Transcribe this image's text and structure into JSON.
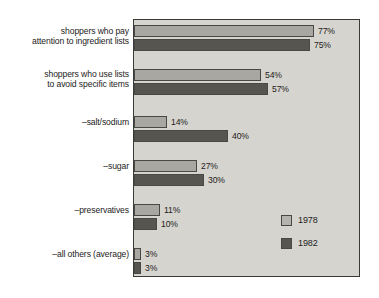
{
  "chart_data": {
    "type": "bar",
    "orientation": "horizontal",
    "title": "",
    "xlabel": "",
    "ylabel": "",
    "xlim": [
      0,
      96
    ],
    "grid": false,
    "legend_position": "inside-bottom-right",
    "value_suffix": "%",
    "categories": [
      "shoppers who pay\nattention to ingredient lists",
      "shoppers who use lists\nto avoid specific items",
      "–salt/sodium",
      "–sugar",
      "–preservatives",
      "–all others (average)"
    ],
    "series": [
      {
        "name": "1978",
        "color": "#a9a7a2",
        "values": [
          77,
          54,
          14,
          27,
          11,
          3
        ],
        "labels": [
          "77%",
          "54%",
          "14%",
          "27%",
          "11%",
          "3%"
        ]
      },
      {
        "name": "1982",
        "color": "#57554f",
        "values": [
          75,
          57,
          40,
          30,
          10,
          3
        ],
        "labels": [
          "75%",
          "57%",
          "40%",
          "30%",
          "10%",
          "3%"
        ]
      }
    ]
  },
  "legend": {
    "entries": [
      {
        "label": "1978"
      },
      {
        "label": "1982"
      }
    ]
  },
  "colors": {
    "series_1978": "#a9a7a2",
    "series_1982": "#57554f",
    "plot_background": "#d6d4cf",
    "frame_border": "#3c3a38",
    "text": "#1d1c1b"
  }
}
